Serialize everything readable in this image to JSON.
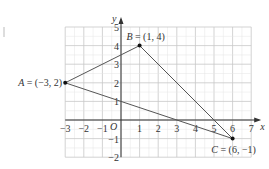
{
  "chart_data": {
    "type": "scatter",
    "title": "",
    "xlabel": "x",
    "ylabel": "y",
    "origin_label": "O",
    "xlim": [
      -3,
      7
    ],
    "ylim": [
      -2,
      5
    ],
    "grid": true,
    "x_ticks": [
      -3,
      -2,
      -1,
      1,
      2,
      3,
      4,
      5,
      6,
      7
    ],
    "y_ticks": [
      -2,
      -1,
      1,
      2,
      3,
      4,
      5
    ],
    "x_tick_labels": [
      "−3",
      "−2",
      "−1",
      "1",
      "2",
      "3",
      "4",
      "5",
      "6",
      "7"
    ],
    "y_tick_labels": [
      "−2",
      "−1",
      "1",
      "2",
      "3",
      "4",
      "5"
    ],
    "points": [
      {
        "name": "A",
        "x": -3,
        "y": 2,
        "label": "A = (−3, 2)",
        "label_pos": "left"
      },
      {
        "name": "B",
        "x": 1,
        "y": 4,
        "label": "B = (1, 4)",
        "label_pos": "above"
      },
      {
        "name": "C",
        "x": 6,
        "y": -1,
        "label": "C = (6, −1)",
        "label_pos": "below"
      }
    ],
    "polygon": [
      "A",
      "B",
      "C"
    ]
  }
}
